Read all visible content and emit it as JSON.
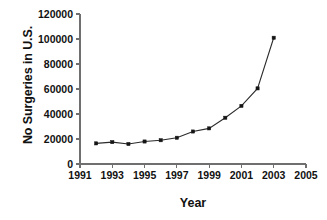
{
  "chart_data": {
    "type": "line",
    "title": "",
    "xlabel": "Year",
    "ylabel": "No Surgeries in U.S.",
    "x": [
      1992,
      1993,
      1994,
      1995,
      1996,
      1997,
      1998,
      1999,
      2000,
      2001,
      2002,
      2003
    ],
    "values": [
      16500,
      17500,
      16000,
      18000,
      19000,
      21000,
      26000,
      28500,
      37000,
      46500,
      60500,
      101000
    ],
    "series": [
      {
        "name": "No Surgeries in U.S.",
        "values": [
          16500,
          17500,
          16000,
          18000,
          19000,
          21000,
          26000,
          28500,
          37000,
          46500,
          60500,
          101000
        ]
      }
    ],
    "xlim": [
      1991,
      2005
    ],
    "ylim": [
      0,
      120000
    ],
    "xticks": [
      1991,
      1993,
      1995,
      1997,
      1999,
      2001,
      2003,
      2005
    ],
    "xtick_labels": [
      "1991",
      "1993",
      "1995",
      "1997",
      "1999",
      "2001",
      "2003",
      "2005"
    ],
    "yticks": [
      0,
      20000,
      40000,
      60000,
      80000,
      100000,
      120000
    ],
    "ytick_labels": [
      "0",
      "20000",
      "40000",
      "60000",
      "80000",
      "100000",
      "120000"
    ],
    "grid": false,
    "legend": false,
    "marker": "square",
    "line_color": "#2b2b2b",
    "marker_color": "#151515",
    "axis_color": "#6f6f6f",
    "background": "#ffffff"
  }
}
